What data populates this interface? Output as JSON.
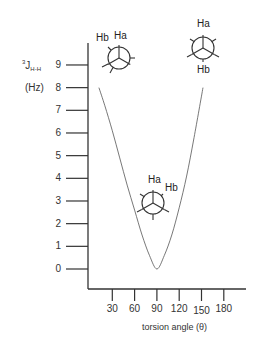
{
  "chart_data": {
    "type": "line",
    "title": "",
    "xlabel": "torsion angle (θ)",
    "ylabel": "³J H-H (Hz)",
    "ylabel_parts": {
      "superscript": "3",
      "main": "J",
      "subscript": "H-H",
      "unit": "(Hz)"
    },
    "x_ticks": [
      30,
      60,
      90,
      120,
      150,
      180
    ],
    "y_ticks": [
      0,
      1,
      2,
      3,
      4,
      5,
      6,
      7,
      8,
      9
    ],
    "xlim": [
      0,
      210
    ],
    "ylim": [
      0,
      9.5
    ],
    "grid": false,
    "legend": null,
    "series": [
      {
        "name": "Karplus curve",
        "x": [
          12,
          20,
          30,
          40,
          50,
          60,
          70,
          80,
          90,
          100,
          110,
          120,
          130,
          140,
          152
        ],
        "y": [
          8.0,
          7.2,
          6.1,
          4.9,
          3.7,
          2.6,
          1.5,
          0.6,
          0.0,
          0.6,
          1.5,
          2.7,
          4.1,
          5.8,
          8.0
        ]
      }
    ],
    "annotations": [
      {
        "type": "newman-projection",
        "position": "near 0°, J≈9",
        "front_label": "Ha",
        "back_label": "Hb",
        "relation": "eclipsed/gauche near 0°"
      },
      {
        "type": "newman-projection",
        "position": "near 90°, J≈3",
        "front_label": "Ha",
        "back_label": "Hb",
        "relation": "~90° dihedral"
      },
      {
        "type": "newman-projection",
        "position": "near 150°, J≈9",
        "front_label": "Ha",
        "back_label": "Hb",
        "relation": "anti (180°)"
      }
    ]
  },
  "axis": {
    "y_title_sup": "3",
    "y_title_main": "J",
    "y_title_sub": "H-H",
    "y_unit": "(Hz)",
    "x_title": "torsion angle (θ)",
    "y_tick_labels": [
      "0",
      "1",
      "2",
      "3",
      "4",
      "5",
      "6",
      "7",
      "8",
      "9"
    ],
    "x_tick_labels": [
      "30",
      "60",
      "90",
      "120",
      "150",
      "180"
    ]
  },
  "newman": {
    "left": {
      "front": "Ha",
      "back": "Hb"
    },
    "right": {
      "front": "Ha",
      "back": "Hb"
    },
    "bottom": {
      "front": "Ha",
      "back": "Hb"
    }
  },
  "colors": {
    "axis": "#333333",
    "curve": "#555555",
    "text": "#333333"
  }
}
